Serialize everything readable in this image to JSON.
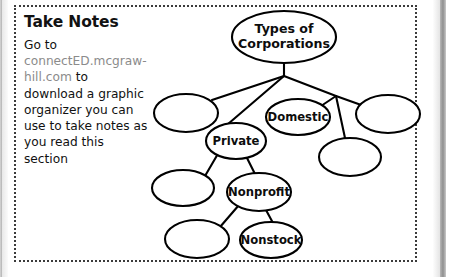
{
  "page": {
    "background_color": "#ffffff",
    "frame_border_color": "#3b3b3b"
  },
  "notes": {
    "title": "Take Notes",
    "body_before_link": "Go to ",
    "link": "connectED.mcgraw-hill.com",
    "body_after_link": " to download a graphic organizer you can use to take notes as you read this section",
    "link_color": "#8b8b8b",
    "text_color": "#111111"
  },
  "diagram": {
    "type": "concept-map",
    "root_label": "Types of Corporations",
    "nodes": [
      {
        "id": "root",
        "label_line1": "Types of",
        "label_line2": "Corporations",
        "cx": 284,
        "cy": 37,
        "rx": 52,
        "ry": 26,
        "font_size": 12.6,
        "filled_label": true
      },
      {
        "id": "left-blank",
        "label": "",
        "cx": 186,
        "cy": 113,
        "rx": 32,
        "ry": 19,
        "font_size": 11,
        "filled_label": false
      },
      {
        "id": "private",
        "label": "Private",
        "cx": 236,
        "cy": 141,
        "rx": 30,
        "ry": 18,
        "font_size": 11.6,
        "filled_label": true
      },
      {
        "id": "domestic",
        "label": "Domestic",
        "cx": 298,
        "cy": 117,
        "rx": 32,
        "ry": 18,
        "font_size": 11.6,
        "filled_label": true
      },
      {
        "id": "right-blank-upper",
        "label": "",
        "cx": 388,
        "cy": 114,
        "rx": 32,
        "ry": 19,
        "font_size": 11,
        "filled_label": false
      },
      {
        "id": "right-blank-lower",
        "label": "",
        "cx": 350,
        "cy": 157,
        "rx": 31,
        "ry": 19,
        "font_size": 11,
        "filled_label": false
      },
      {
        "id": "lower-left-blank",
        "label": "",
        "cx": 183,
        "cy": 188,
        "rx": 31,
        "ry": 18,
        "font_size": 11,
        "filled_label": false
      },
      {
        "id": "nonprofit",
        "label": "Nonprofit",
        "cx": 259,
        "cy": 192,
        "rx": 32,
        "ry": 19,
        "font_size": 11.6,
        "filled_label": true
      },
      {
        "id": "bottom-left-blank",
        "label": "",
        "cx": 197,
        "cy": 239,
        "rx": 32,
        "ry": 19,
        "font_size": 11,
        "filled_label": false
      },
      {
        "id": "nonstock",
        "label": "Nonstock",
        "cx": 271,
        "cy": 240,
        "rx": 31,
        "ry": 18,
        "font_size": 11.6,
        "filled_label": true
      }
    ],
    "junctions": [
      {
        "id": "left-junction",
        "x": 284,
        "y": 76
      },
      {
        "id": "right-junction",
        "x": 336,
        "y": 96
      }
    ],
    "edges": [
      {
        "from": "root",
        "to": "left-junction",
        "x1": 284,
        "y1": 63,
        "x2": 284,
        "y2": 76
      },
      {
        "from": "left-junction",
        "to": "left-blank",
        "x1": 284,
        "y1": 76,
        "x2": 212,
        "y2": 100
      },
      {
        "from": "left-junction",
        "to": "private",
        "x1": 284,
        "y1": 76,
        "x2": 228,
        "y2": 124
      },
      {
        "from": "left-junction",
        "to": "right-junction",
        "x1": 284,
        "y1": 76,
        "x2": 336,
        "y2": 96
      },
      {
        "from": "right-junction",
        "to": "domestic",
        "x1": 336,
        "y1": 96,
        "x2": 318,
        "y2": 108
      },
      {
        "from": "right-junction",
        "to": "right-blank-upper",
        "x1": 336,
        "y1": 96,
        "x2": 364,
        "y2": 106
      },
      {
        "from": "right-junction",
        "to": "right-blank-lower",
        "x1": 336,
        "y1": 96,
        "x2": 345,
        "y2": 138
      },
      {
        "from": "private",
        "to": "lower-left-blank",
        "x1": 219,
        "y1": 152,
        "x2": 205,
        "y2": 176
      },
      {
        "from": "private",
        "to": "nonprofit",
        "x1": 246,
        "y1": 156,
        "x2": 255,
        "y2": 174
      },
      {
        "from": "nonprofit",
        "to": "bottom-left-blank",
        "x1": 239,
        "y1": 205,
        "x2": 220,
        "y2": 227
      },
      {
        "from": "nonprofit",
        "to": "nonstock",
        "x1": 266,
        "y1": 210,
        "x2": 273,
        "y2": 223
      }
    ],
    "labeled_node_count": 5,
    "blank_node_count": 5,
    "stroke_color": "#000000",
    "fill_color": "#ffffff"
  }
}
